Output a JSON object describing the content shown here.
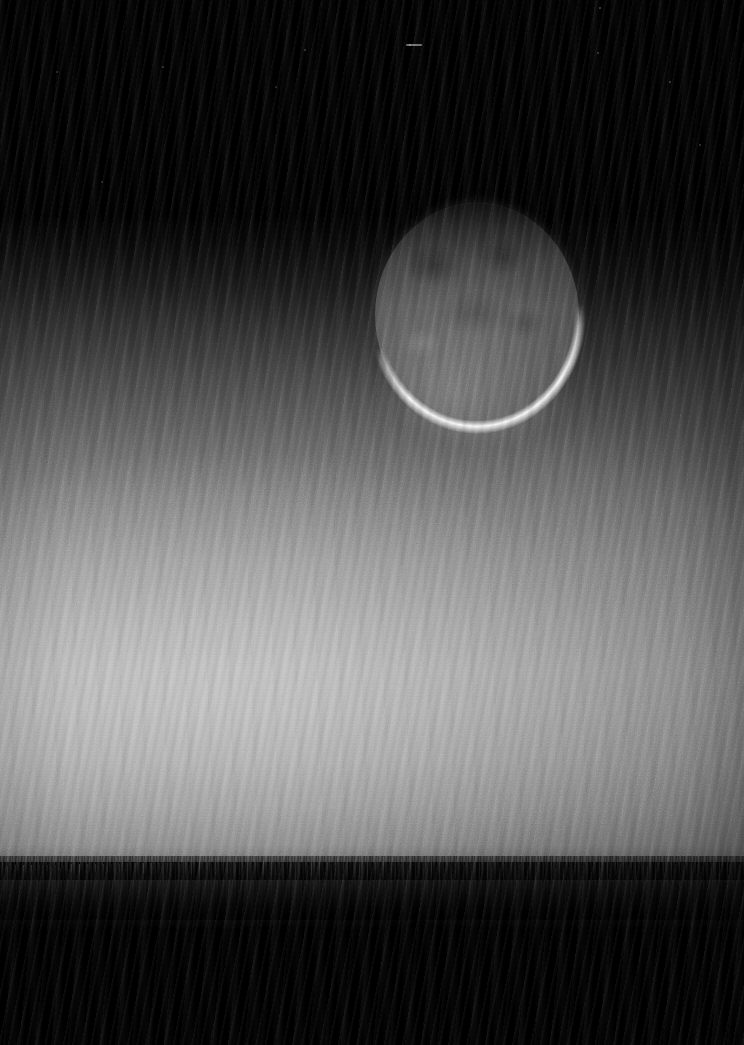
{
  "image": {
    "title": "Crescent Moon Over Twilight Horizon",
    "subject": "thin waning crescent moon with earthshine above a bright twilight glow and dark treeline silhouette",
    "width_px": 744,
    "height_px": 1045,
    "capture_style": "long-exposure digital still, heavy diagonal moire / scanline interference, monochrome"
  },
  "palette": {
    "night_sky": "#000000",
    "deep_twilight": "#1a1a1a",
    "mid_twilight": "#808080",
    "glow_peak": "#b4b4b4",
    "moon_earthshine": "#606060",
    "moon_limb_highlight": "#ffffff",
    "horizon_band": "#1e1e1e",
    "foreground_silhouette": "#000000"
  },
  "regions": [
    {
      "name": "night-sky",
      "label": "Night sky",
      "y_range_px": [
        0,
        215
      ],
      "description": "Pure black upper sky with a handful of very faint stars"
    },
    {
      "name": "twilight-gradient",
      "label": "Twilight gradient",
      "y_range_px": [
        215,
        620
      ],
      "description": "Sky brightens steadily downward from black to light grey"
    },
    {
      "name": "glow-peak",
      "label": "Glow peak band",
      "y_range_px": [
        620,
        780
      ],
      "description": "Brightest zone of the airglow, strongest left of centre"
    },
    {
      "name": "lower-falloff",
      "label": "Lower falloff",
      "y_range_px": [
        780,
        856
      ],
      "description": "Brightness decreases again toward the horizon"
    },
    {
      "name": "horizon-band",
      "label": "Horizon haze band",
      "y_range_px": [
        856,
        920
      ],
      "description": "Dark textured treeline haze with dense speckle"
    },
    {
      "name": "foreground",
      "label": "Foreground silhouette",
      "y_range_px": [
        915,
        1045
      ],
      "description": "Solid black ragged silhouette occupying the lower frame"
    }
  ],
  "moon": {
    "label": "Crescent moon",
    "center_px": [
      477,
      315
    ],
    "width_px": 204,
    "height_px": 224,
    "phase": "thin waning crescent",
    "earthshine_visible": true,
    "lit_limb": "lower / lower-left",
    "lit_limb_brightness": "blown-out white",
    "disc_brightness": "dim grey earthshine with faint maria mottling"
  },
  "stars": [
    {
      "x": 410,
      "y": 45,
      "r": 0.9,
      "opacity": 0.35
    },
    {
      "x": 600,
      "y": 8,
      "r": 1.0,
      "opacity": 0.3
    },
    {
      "x": 670,
      "y": 82,
      "r": 0.8,
      "opacity": 0.26
    },
    {
      "x": 598,
      "y": 53,
      "r": 0.7,
      "opacity": 0.22
    },
    {
      "x": 305,
      "y": 50,
      "r": 0.7,
      "opacity": 0.2
    },
    {
      "x": 57,
      "y": 72,
      "r": 0.7,
      "opacity": 0.18
    },
    {
      "x": 163,
      "y": 67,
      "r": 0.6,
      "opacity": 0.16
    },
    {
      "x": 276,
      "y": 87,
      "r": 0.6,
      "opacity": 0.15
    },
    {
      "x": 102,
      "y": 182,
      "r": 0.6,
      "opacity": 0.14
    },
    {
      "x": 700,
      "y": 145,
      "r": 0.7,
      "opacity": 0.2
    },
    {
      "x": 60,
      "y": 1010,
      "r": 0.8,
      "opacity": 0.25
    },
    {
      "x": 480,
      "y": 975,
      "r": 0.6,
      "opacity": 0.15
    }
  ],
  "star_streak": {
    "x": 406,
    "y": 44,
    "w": 16,
    "h": 2
  }
}
